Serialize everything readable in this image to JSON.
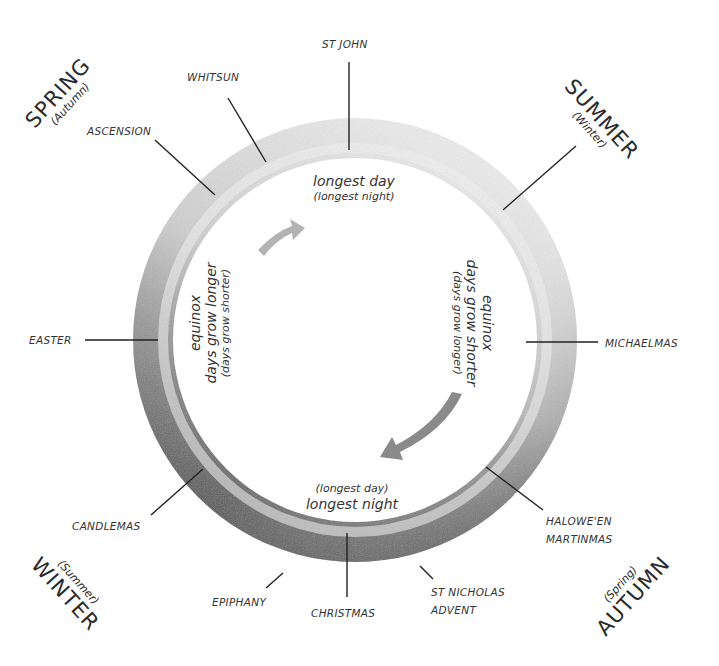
{
  "diagram": {
    "seasons": {
      "spring": {
        "name": "SPRING",
        "alt": "(Autumn)"
      },
      "summer": {
        "name": "SUMMER",
        "alt": "(Winter)"
      },
      "autumn": {
        "name": "AUTUMN",
        "alt": "(Spring)"
      },
      "winter": {
        "name": "WINTER",
        "alt": "(Summer)"
      }
    },
    "festivals": {
      "st_john": "ST JOHN",
      "whitsun": "WHITSUN",
      "ascension": "ASCENSION",
      "easter": "EASTER",
      "candlemas": "CANDLEMAS",
      "epiphany": "EPIPHANY",
      "christmas": "CHRISTMAS",
      "st_nicholas": "ST NICHOLAS",
      "advent": "ADVENT",
      "halloween": "HALOWE'EN",
      "martinmas": "MARTINMAS",
      "michaelmas": "MICHAELMAS"
    },
    "inner": {
      "top": {
        "main": "longest day",
        "sub": "(longest night)"
      },
      "bottom": {
        "sub": "(longest day)",
        "main": "longest night"
      },
      "left": {
        "l1": "equinox",
        "l2": "days grow longer",
        "l3": "(days grow shorter)"
      },
      "right": {
        "l1": "equinox",
        "l2": "days grow shorter",
        "l3": "(days grow longer)"
      }
    },
    "colors": {
      "ring_light": "#e4e4e4",
      "ring_dark": "#5a5a5a",
      "leader_line": "#222222",
      "arrow": "#9a9a9a"
    }
  }
}
